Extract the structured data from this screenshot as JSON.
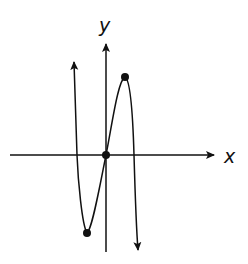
{
  "figure": {
    "type": "function-graph",
    "axes": {
      "x_label": "x",
      "y_label": "y"
    },
    "curve": {
      "end_behavior": "rises to the left, falls to the right",
      "marked_points": [
        {
          "name": "local-minimum",
          "position": "below x-axis, left of y-axis"
        },
        {
          "name": "origin",
          "position": "intersection of axes"
        },
        {
          "name": "local-maximum",
          "position": "above x-axis, right of y-axis"
        }
      ]
    },
    "colors": {
      "ink": "#111111",
      "background": "#ffffff"
    }
  }
}
